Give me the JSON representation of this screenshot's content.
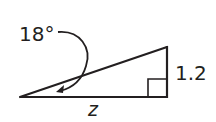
{
  "diagram": {
    "type": "right-triangle",
    "angle_label": "18°",
    "opposite_side_label": "1.2",
    "adjacent_side_label": "z",
    "stroke_color": "#231f20",
    "background_color": "#ffffff",
    "has_right_angle_marker": true,
    "has_angle_arrow": true
  }
}
